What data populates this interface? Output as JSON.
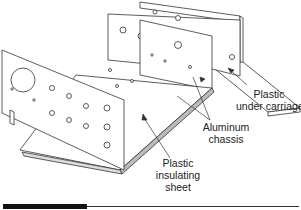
{
  "diagram": {
    "labels": {
      "plastic_under_carriage": [
        "Plastic",
        "under carriage"
      ],
      "aluminum_chassis": [
        "Aluminum",
        "chassis"
      ],
      "plastic_insulating_sheet": [
        "Plastic",
        "insulating",
        "sheet"
      ]
    },
    "colors": {
      "line": "#333333",
      "fill": "#ffffff",
      "shade": "#bbbbbb",
      "footer_bar": "#111111"
    }
  }
}
